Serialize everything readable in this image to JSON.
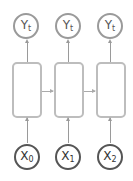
{
  "diagram": {
    "outputs": [
      {
        "label": "Y",
        "sub": "t"
      },
      {
        "label": "Y",
        "sub": "t"
      },
      {
        "label": "Y",
        "sub": "t"
      }
    ],
    "inputs": [
      {
        "label": "X",
        "sub": "0"
      },
      {
        "label": "X",
        "sub": "1"
      },
      {
        "label": "X",
        "sub": "2"
      }
    ],
    "colors": {
      "output_stroke": "#9a9a9a",
      "input_stroke": "#555555",
      "cell_stroke": "#bdbdbd"
    }
  }
}
